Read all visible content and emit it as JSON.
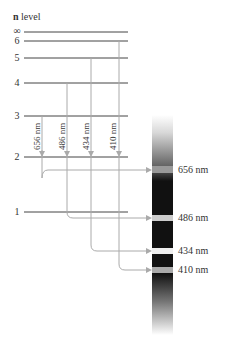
{
  "title": {
    "bold": "n",
    "rest": " level"
  },
  "levels": [
    {
      "n": "∞",
      "y": 32
    },
    {
      "n": "6",
      "y": 41
    },
    {
      "n": "5",
      "y": 58
    },
    {
      "n": "4",
      "y": 83
    },
    {
      "n": "3",
      "y": 116
    },
    {
      "n": "2",
      "y": 157
    },
    {
      "n": "1",
      "y": 212
    }
  ],
  "transitions": [
    {
      "label": "656 nm",
      "from": "3",
      "to": "2"
    },
    {
      "label": "486 nm",
      "from": "4",
      "to": "2"
    },
    {
      "label": "434 nm",
      "from": "5",
      "to": "2"
    },
    {
      "label": "410 nm",
      "from": "6",
      "to": "2"
    }
  ],
  "spectrum_lines": [
    {
      "label": "656 nm",
      "y": 170
    },
    {
      "label": "486 nm",
      "y": 218
    },
    {
      "label": "434 nm",
      "y": 251
    },
    {
      "label": "410 nm",
      "y": 270
    }
  ],
  "colors": {
    "line": "#444444",
    "arrow": "#aaaaaa",
    "spectrum": "#111111"
  }
}
